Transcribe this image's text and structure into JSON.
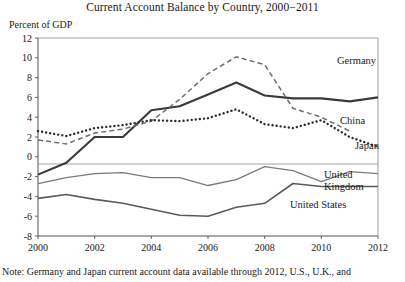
{
  "figure": {
    "title": "Current Account Balance by Country, 2000−2011",
    "unit_label": "Percent of GDP",
    "footnote": "Note: Germany and Japan current account data available through 2012, U.S., U.K., and"
  },
  "labels": {
    "germany": "Germany",
    "china": "China",
    "japan": "Japan",
    "united_kingdom_line1": "United",
    "united_kingdom_line2": "Kingdom",
    "united_states": "United States"
  },
  "chart_data": {
    "type": "line",
    "title": "Current Account Balance by Country, 2000−2011",
    "xlabel": "",
    "ylabel": "Percent of GDP",
    "xlim": [
      2000,
      2012
    ],
    "ylim": [
      -8,
      12
    ],
    "yticks": [
      12,
      10,
      8,
      6,
      4,
      2,
      0,
      -2,
      -4,
      -6,
      -8
    ],
    "xticks": [
      2000,
      2002,
      2004,
      2006,
      2008,
      2010,
      2012
    ],
    "grid": false,
    "zero_line": true,
    "legend": "inline-labels",
    "series": [
      {
        "name": "Germany",
        "style": "solid-thick",
        "color": "#3a3a3a",
        "x": [
          2000,
          2001,
          2002,
          2003,
          2004,
          2005,
          2006,
          2007,
          2008,
          2009,
          2010,
          2011,
          2012
        ],
        "values": [
          -1.8,
          -0.6,
          2.0,
          2.0,
          4.7,
          5.1,
          6.3,
          7.5,
          6.2,
          5.9,
          5.9,
          5.6,
          6.0
        ]
      },
      {
        "name": "China",
        "style": "dashed",
        "color": "#6e6e6e",
        "x": [
          2000,
          2001,
          2002,
          2003,
          2004,
          2005,
          2006,
          2007,
          2008,
          2009,
          2010,
          2011
        ],
        "values": [
          1.7,
          1.3,
          2.4,
          2.8,
          3.6,
          5.8,
          8.4,
          10.1,
          9.3,
          4.9,
          4.0,
          2.6
        ]
      },
      {
        "name": "Japan",
        "style": "dotted",
        "color": "#2e2e2e",
        "x": [
          2000,
          2001,
          2002,
          2003,
          2004,
          2005,
          2006,
          2007,
          2008,
          2009,
          2010,
          2011,
          2012
        ],
        "values": [
          2.6,
          2.1,
          2.9,
          3.2,
          3.7,
          3.6,
          3.9,
          4.8,
          3.3,
          2.9,
          3.7,
          2.0,
          1.0
        ]
      },
      {
        "name": "United Kingdom",
        "style": "solid-thin",
        "color": "#7a7a7a",
        "x": [
          2000,
          2001,
          2002,
          2003,
          2004,
          2005,
          2006,
          2007,
          2008,
          2009,
          2010,
          2011,
          2012
        ],
        "values": [
          -2.7,
          -2.1,
          -1.7,
          -1.6,
          -2.1,
          -2.1,
          -2.9,
          -2.3,
          -1.0,
          -1.4,
          -2.5,
          -1.5,
          -1.7
        ]
      },
      {
        "name": "United States",
        "style": "solid-medium",
        "color": "#5a5a5a",
        "x": [
          2000,
          2001,
          2002,
          2003,
          2004,
          2005,
          2006,
          2007,
          2008,
          2009,
          2010,
          2011,
          2012
        ],
        "values": [
          -4.2,
          -3.8,
          -4.3,
          -4.7,
          -5.3,
          -5.9,
          -6.0,
          -5.1,
          -4.7,
          -2.7,
          -3.0,
          -3.0,
          -3.0
        ]
      }
    ]
  }
}
